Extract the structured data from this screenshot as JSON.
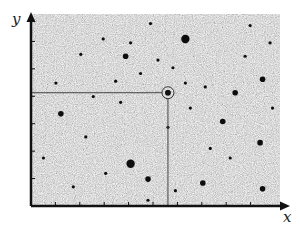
{
  "diagram": {
    "type": "star-field-coordinate-diagram",
    "axes": {
      "x_label": "x",
      "y_label": "y"
    },
    "target": {
      "description": "circled star with coordinate guide lines to both axes",
      "x_fraction": 0.55,
      "y_fraction": 0.41
    },
    "colors": {
      "background_noise_mid": "#b4b4b4",
      "star": "#111111",
      "axis": "#111111",
      "guide_line": "#444444"
    },
    "stars": [
      {
        "x": 0.4,
        "y": 0.78,
        "mag": 3
      },
      {
        "x": 0.47,
        "y": 0.86,
        "mag": 2
      },
      {
        "x": 0.69,
        "y": 0.88,
        "mag": 2
      },
      {
        "x": 0.93,
        "y": 0.91,
        "mag": 2
      },
      {
        "x": 0.22,
        "y": 0.64,
        "mag": 1
      },
      {
        "x": 0.12,
        "y": 0.52,
        "mag": 2
      },
      {
        "x": 0.55,
        "y": 0.59,
        "mag": 1
      },
      {
        "x": 0.77,
        "y": 0.56,
        "mag": 2
      },
      {
        "x": 0.92,
        "y": 0.67,
        "mag": 2
      },
      {
        "x": 0.82,
        "y": 0.41,
        "mag": 2
      },
      {
        "x": 0.55,
        "y": 0.41,
        "mag": 2
      },
      {
        "x": 0.97,
        "y": 0.49,
        "mag": 1
      },
      {
        "x": 0.93,
        "y": 0.34,
        "mag": 2
      },
      {
        "x": 0.38,
        "y": 0.22,
        "mag": 2
      },
      {
        "x": 0.62,
        "y": 0.13,
        "mag": 3
      },
      {
        "x": 0.2,
        "y": 0.21,
        "mag": 1
      },
      {
        "x": 0.29,
        "y": 0.13,
        "mag": 1
      },
      {
        "x": 0.4,
        "y": 0.15,
        "mag": 1
      },
      {
        "x": 0.34,
        "y": 0.35,
        "mag": 1
      },
      {
        "x": 0.44,
        "y": 0.31,
        "mag": 1
      },
      {
        "x": 0.51,
        "y": 0.24,
        "mag": 1
      },
      {
        "x": 0.86,
        "y": 0.22,
        "mag": 1
      },
      {
        "x": 0.57,
        "y": 0.28,
        "mag": 1
      },
      {
        "x": 0.1,
        "y": 0.36,
        "mag": 1
      },
      {
        "x": 0.25,
        "y": 0.43,
        "mag": 1
      },
      {
        "x": 0.36,
        "y": 0.46,
        "mag": 1
      },
      {
        "x": 0.64,
        "y": 0.49,
        "mag": 1
      },
      {
        "x": 0.72,
        "y": 0.7,
        "mag": 1
      },
      {
        "x": 0.3,
        "y": 0.83,
        "mag": 1
      },
      {
        "x": 0.17,
        "y": 0.9,
        "mag": 1
      },
      {
        "x": 0.58,
        "y": 0.92,
        "mag": 1
      },
      {
        "x": 0.8,
        "y": 0.75,
        "mag": 1
      },
      {
        "x": 0.47,
        "y": 0.97,
        "mag": 1
      },
      {
        "x": 0.05,
        "y": 0.75,
        "mag": 1
      },
      {
        "x": 0.88,
        "y": 0.06,
        "mag": 1
      },
      {
        "x": 0.48,
        "y": 0.05,
        "mag": 1
      },
      {
        "x": 0.96,
        "y": 0.15,
        "mag": 1
      },
      {
        "x": 0.7,
        "y": 0.38,
        "mag": 1
      },
      {
        "x": 0.62,
        "y": 0.36,
        "mag": 1
      }
    ]
  }
}
